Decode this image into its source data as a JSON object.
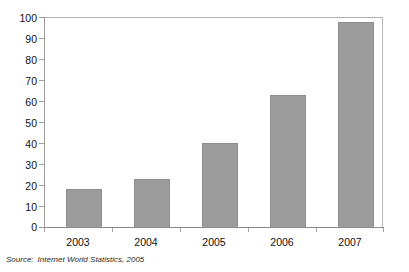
{
  "chart_data": {
    "type": "bar",
    "title": "",
    "subtitle": "",
    "xlabel": "",
    "ylabel": "",
    "categories": [
      "2003",
      "2004",
      "2005",
      "2006",
      "2007"
    ],
    "values": [
      18.5,
      23,
      40.5,
      63,
      97.5
    ],
    "series": [
      {
        "name": "Value",
        "values": [
          18.5,
          23,
          40.5,
          63,
          97.5
        ]
      }
    ],
    "ylim": [
      0,
      100
    ],
    "ytick_labels": [
      "100",
      "90",
      "80",
      "70",
      "60",
      "50",
      "40",
      "30",
      "20",
      "10",
      "0"
    ],
    "ytick_values": [
      100,
      90,
      80,
      70,
      60,
      50,
      40,
      30,
      20,
      10,
      0
    ],
    "grid": false,
    "legend": "none",
    "bar_color": "#9c9c9c",
    "bar_border_color": "#8e8e8e",
    "frame_color": "#b8b8b8",
    "axis_color": "#8a8a8a"
  },
  "source": {
    "label": "Source:",
    "text": "Internet World Statistics, 2005"
  }
}
